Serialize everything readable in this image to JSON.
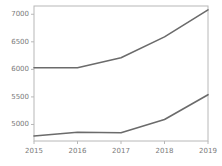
{
  "chart_data": {
    "type": "line",
    "title": "",
    "xlabel": "",
    "ylabel": "",
    "x": [
      2015,
      2016,
      2017,
      2018,
      2019
    ],
    "categories": [
      "2015",
      "2016",
      "2017",
      "2018",
      "2019"
    ],
    "xtick_labels": [
      "2015",
      "2016",
      "2017",
      "2018",
      "2019"
    ],
    "ytick_labels": [
      "5000",
      "5500",
      "6000",
      "6500",
      "7000"
    ],
    "ytick_values": [
      5000,
      5500,
      6000,
      6500,
      7000
    ],
    "xlim": [
      2015,
      2019
    ],
    "ylim": [
      4700,
      7150
    ],
    "grid": false,
    "legend": false,
    "legend_position": "none",
    "series": [
      {
        "name": "upper",
        "color": "#6b6b6b",
        "values": [
          6030,
          6030,
          6210,
          6590,
          7080
        ]
      },
      {
        "name": "lower",
        "color": "#6b6b6b",
        "values": [
          4790,
          4860,
          4850,
          5090,
          5540
        ]
      }
    ]
  },
  "style": {
    "line_color": "#6b6b6b",
    "axis_color": "#b8b8b8",
    "tick_color": "#b8b8b8",
    "label_color": "#7a7a7a",
    "background": "#ffffff"
  },
  "axes": {
    "plot_left": 34,
    "plot_right": 208,
    "plot_top": 6,
    "plot_bottom": 141
  }
}
